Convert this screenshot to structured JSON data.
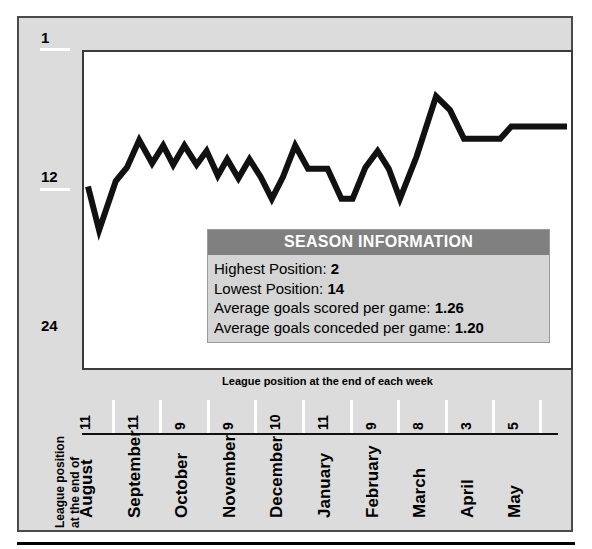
{
  "panel": {
    "caption": "League position at the end of each week",
    "y_axis": {
      "title_line1": "League position",
      "title_line2": "at the end of",
      "ticks": [
        {
          "label": "1",
          "value": 1
        },
        {
          "label": "12",
          "value": 12
        },
        {
          "label": "24",
          "value": 24
        }
      ]
    },
    "x_axis": {
      "months": [
        {
          "month": "August",
          "weeks": "11"
        },
        {
          "month": "September",
          "weeks": "11"
        },
        {
          "month": "October",
          "weeks": "9"
        },
        {
          "month": "November",
          "weeks": "9"
        },
        {
          "month": "December",
          "weeks": "10"
        },
        {
          "month": "January",
          "weeks": "11"
        },
        {
          "month": "February",
          "weeks": "9"
        },
        {
          "month": "March",
          "weeks": "8"
        },
        {
          "month": "April",
          "weeks": "3"
        },
        {
          "month": "May",
          "weeks": "5"
        }
      ]
    }
  },
  "info_box": {
    "title": "SEASON INFORMATION",
    "rows": [
      {
        "label": "Highest Position:",
        "value": "2"
      },
      {
        "label": "Lowest Position:",
        "value": "14"
      },
      {
        "label": "Average goals scored per game:",
        "value": "1.26"
      },
      {
        "label": "Average goals conceded per game:",
        "value": "1.20"
      }
    ]
  },
  "colors": {
    "panel_bg": "#dcdcdc",
    "plot_bg": "#ffffff",
    "line": "#111111",
    "info_header": "#808080",
    "info_body": "#d5d5d5",
    "tick": "#ffffff"
  },
  "chart_data": {
    "type": "line",
    "title": "",
    "subtitle": "",
    "xlabel": "League position at the end of each week",
    "ylabel": "League position at the end of",
    "ylim": [
      1,
      24
    ],
    "y_inverted": true,
    "ytick_labels": [
      "1",
      "12",
      "24"
    ],
    "ytick_values": [
      1,
      12,
      24
    ],
    "grid": false,
    "legend": "none",
    "annotations": [
      "Highest Position: 2",
      "Lowest Position: 14",
      "Average goals scored per game: 1.26",
      "Average goals conceded per game: 1.20"
    ],
    "x": [
      1,
      2,
      3,
      4,
      5,
      6,
      7,
      8,
      9,
      10,
      11,
      12,
      13,
      14,
      15,
      16,
      17,
      18,
      19,
      20,
      21,
      22,
      23,
      24,
      25,
      26,
      27,
      28,
      29,
      30,
      31,
      32,
      33,
      34,
      35,
      36,
      37,
      38,
      39,
      40,
      41,
      42,
      43,
      44,
      45,
      46,
      47,
      48,
      49,
      50,
      51,
      52,
      53,
      54,
      55,
      56,
      57,
      58,
      59,
      60,
      61,
      62,
      63,
      64,
      65,
      66,
      67,
      68,
      69,
      70,
      71,
      72,
      73,
      74,
      75,
      76,
      77,
      78,
      79,
      80,
      81,
      82,
      83,
      84,
      85,
      86
    ],
    "values": [
      11,
      14,
      11,
      10,
      10,
      8,
      9,
      10,
      9,
      10,
      9,
      10,
      9,
      10,
      10,
      11,
      10,
      9,
      12,
      11,
      9,
      8,
      9,
      10,
      10,
      10,
      10,
      10,
      10,
      9,
      10,
      11,
      11,
      11,
      9,
      9,
      9,
      9,
      11,
      11,
      11,
      6,
      5,
      7,
      7,
      7,
      7,
      7,
      7,
      7,
      7,
      7,
      7,
      7,
      7,
      7,
      7,
      7,
      7,
      7,
      7,
      7,
      7,
      7,
      7,
      7,
      7,
      7,
      7,
      7,
      7,
      7,
      7,
      7,
      7,
      7,
      7,
      7,
      7,
      7,
      7,
      7,
      7,
      7,
      7,
      7
    ],
    "series": [
      {
        "name": "League position",
        "points": [
          [
            0.0,
            11.0
          ],
          [
            2.0,
            14.2
          ],
          [
            5.0,
            10.6
          ],
          [
            7.0,
            9.6
          ],
          [
            9.2,
            7.6
          ],
          [
            11.5,
            9.3
          ],
          [
            13.5,
            8.0
          ],
          [
            15.3,
            9.4
          ],
          [
            17.3,
            8.0
          ],
          [
            19.5,
            9.4
          ],
          [
            21.3,
            8.4
          ],
          [
            23.3,
            10.2
          ],
          [
            25.0,
            9.0
          ],
          [
            27.0,
            10.4
          ],
          [
            29.0,
            9.0
          ],
          [
            31.0,
            10.3
          ],
          [
            33.0,
            11.9
          ],
          [
            35.0,
            10.3
          ],
          [
            37.2,
            8.0
          ],
          [
            39.5,
            9.7
          ],
          [
            43.0,
            9.7
          ],
          [
            45.5,
            11.9
          ],
          [
            47.5,
            11.9
          ],
          [
            49.8,
            9.6
          ],
          [
            52.0,
            8.4
          ],
          [
            54.0,
            9.7
          ],
          [
            56.0,
            11.9
          ],
          [
            59.0,
            8.8
          ],
          [
            62.5,
            4.4
          ],
          [
            65.0,
            5.4
          ],
          [
            67.5,
            7.5
          ],
          [
            74.0,
            7.5
          ],
          [
            76.0,
            6.6
          ],
          [
            79.5,
            6.6
          ],
          [
            86.0,
            6.6
          ]
        ]
      }
    ]
  }
}
